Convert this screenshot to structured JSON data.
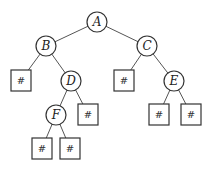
{
  "diagram": {
    "type": "binary-tree",
    "nodes": {
      "A": {
        "label": "A"
      },
      "B": {
        "label": "B"
      },
      "C": {
        "label": "C"
      },
      "D": {
        "label": "D"
      },
      "E": {
        "label": "E"
      },
      "F": {
        "label": "F"
      }
    },
    "null_label": "#",
    "edges": [
      [
        "A",
        "B"
      ],
      [
        "A",
        "C"
      ],
      [
        "B",
        "#"
      ],
      [
        "B",
        "D"
      ],
      [
        "C",
        "#"
      ],
      [
        "C",
        "E"
      ],
      [
        "D",
        "F"
      ],
      [
        "D",
        "#"
      ],
      [
        "E",
        "#"
      ],
      [
        "E",
        "#"
      ],
      [
        "F",
        "#"
      ],
      [
        "F",
        "#"
      ]
    ]
  }
}
